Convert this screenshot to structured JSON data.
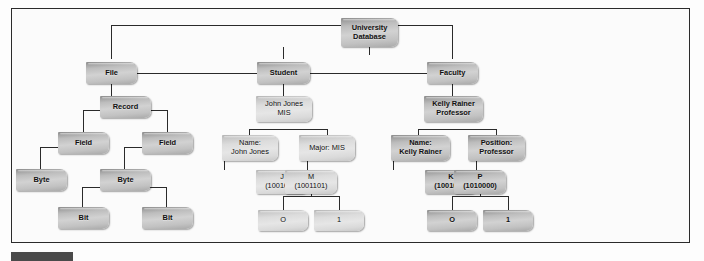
{
  "figure": {
    "frame_color": "#2b2b2b",
    "line_color": "#2a2a2a",
    "caption_bar_color": "#4a4a4a"
  },
  "nodes": {
    "root": {
      "label": "University\nDatabase"
    },
    "file": {
      "label": "File"
    },
    "student": {
      "label": "Student"
    },
    "faculty": {
      "label": "Faculty"
    },
    "record": {
      "label": "Record"
    },
    "field_left": {
      "label": "Field"
    },
    "field_right": {
      "label": "Field"
    },
    "byte_left": {
      "label": "Byte"
    },
    "byte_right": {
      "label": "Byte"
    },
    "bit_left": {
      "label": "Bit"
    },
    "bit_right": {
      "label": "Bit"
    },
    "student_record": {
      "label": "John Jones\nMIS"
    },
    "student_field_name": {
      "label": "Name:\nJohn Jones"
    },
    "student_field_major": {
      "label": "Major: MIS"
    },
    "student_byte_j": {
      "label": "J\n(1001010)"
    },
    "student_byte_m": {
      "label": "M\n(1001101)"
    },
    "student_bit_0": {
      "label": "O"
    },
    "student_bit_1": {
      "label": "1"
    },
    "faculty_record": {
      "label": "Kelly Rainer\nProfessor"
    },
    "faculty_field_name": {
      "label": "Name:\nKelly Rainer"
    },
    "faculty_field_position": {
      "label": "Position:\nProfessor"
    },
    "faculty_byte_k": {
      "label": "K\n(1001011)"
    },
    "faculty_byte_p": {
      "label": "P\n(1010000)"
    },
    "faculty_bit_0": {
      "label": "O"
    },
    "faculty_bit_1": {
      "label": "1"
    }
  }
}
